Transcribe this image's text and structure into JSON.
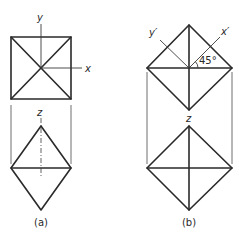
{
  "figure": {
    "panel_a": {
      "caption": "(a)",
      "top_view_labels": {
        "y_axis": "y",
        "x_axis": "x"
      },
      "front_view_labels": {
        "z_axis": "z"
      }
    },
    "panel_b": {
      "caption": "(b)",
      "top_view_labels": {
        "y_axis": "y′",
        "x_axis": "x′",
        "angle": "45°"
      },
      "front_view_labels": {
        "z_axis": "z"
      }
    }
  }
}
